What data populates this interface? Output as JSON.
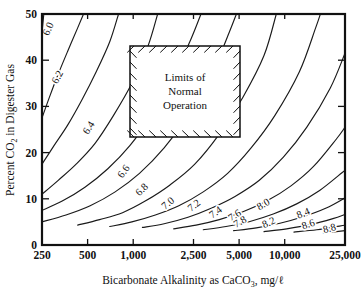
{
  "figure": {
    "title": "",
    "background": "#ffffff",
    "line_color": "#1a1a1a"
  },
  "axes": {
    "x": {
      "label_prefix": "Bicarbonate Alkalinity as CaCO",
      "label_sub": "3",
      "label_suffix": ", mg/ℓ",
      "full_label": "Bicarbonate Alkalinity as CaCO3, mg/ℓ",
      "tick_labels": [
        "250",
        "500",
        "1,000",
        "2,500",
        "5,000",
        "10,000",
        "25,000"
      ],
      "tick_values": [
        250,
        500,
        1000,
        2500,
        5000,
        10000,
        25000
      ],
      "scale": "log",
      "range": [
        250,
        25000
      ]
    },
    "y": {
      "label_prefix": "Percent CO",
      "label_sub": "2",
      "label_suffix": " in Digester Gas",
      "full_label": "Percent CO2 in Digester Gas",
      "tick_labels": [
        "0",
        "10",
        "20",
        "30",
        "40",
        "50"
      ],
      "tick_values": [
        0,
        10,
        20,
        30,
        40,
        50
      ],
      "scale": "linear",
      "range": [
        0,
        50
      ]
    }
  },
  "annotation_box": {
    "lines": [
      "Limits of",
      "Normal",
      "Operation"
    ],
    "x_range": [
      1000,
      5000
    ],
    "y_range": [
      25,
      44
    ],
    "hatched": true
  },
  "chart_data": {
    "type": "line",
    "title": "",
    "subtitle": "",
    "xlabel": "Bicarbonate Alkalinity as CaCO3, mg/ℓ",
    "ylabel": "Percent CO2 in Digester Gas",
    "xlim": [
      250,
      25000
    ],
    "ylim": [
      0,
      50
    ],
    "xscale": "log",
    "yscale": "linear",
    "grid": false,
    "legend": "none",
    "annotations": [
      "Limits of Normal Operation"
    ],
    "contour_variable": "pH",
    "contour_levels": [
      6.0,
      6.2,
      6.4,
      6.6,
      6.8,
      7.0,
      7.2,
      7.4,
      7.6,
      7.8,
      8.0,
      8.2,
      8.4,
      8.6,
      8.8
    ],
    "series": [
      {
        "name": "6.0",
        "label": "6.0",
        "label_pos": [
          288,
          46.5
        ],
        "label_rot": -66,
        "points": [
          [
            250,
            46.0
          ],
          [
            257,
            50.0
          ]
        ]
      },
      {
        "name": "6.2",
        "label": "6.2",
        "label_pos": [
          330,
          36.0
        ],
        "label_rot": -62,
        "points": [
          [
            250,
            27.5
          ],
          [
            280,
            32.0
          ],
          [
            320,
            37.0
          ],
          [
            370,
            42.0
          ],
          [
            430,
            47.0
          ],
          [
            470,
            50.0
          ]
        ]
      },
      {
        "name": "6.4",
        "label": "6.4",
        "label_pos": [
          530,
          25.0
        ],
        "label_rot": -58,
        "points": [
          [
            250,
            17.5
          ],
          [
            300,
            21.5
          ],
          [
            370,
            26.0
          ],
          [
            460,
            31.5
          ],
          [
            570,
            37.5
          ],
          [
            700,
            44.0
          ],
          [
            800,
            50.0
          ]
        ]
      },
      {
        "name": "6.6",
        "label": "6.6",
        "label_pos": [
          900,
          15.5
        ],
        "label_rot": -53,
        "points": [
          [
            250,
            11.0
          ],
          [
            320,
            14.0
          ],
          [
            420,
            17.5
          ],
          [
            560,
            22.0
          ],
          [
            740,
            28.0
          ],
          [
            980,
            35.0
          ],
          [
            1250,
            43.0
          ],
          [
            1450,
            50.0
          ]
        ]
      },
      {
        "name": "6.8",
        "label": "6.8",
        "label_pos": [
          1180,
          11.5
        ],
        "label_rot": -45,
        "points": [
          [
            250,
            7.5
          ],
          [
            340,
            9.5
          ],
          [
            480,
            12.5
          ],
          [
            680,
            16.5
          ],
          [
            950,
            21.5
          ],
          [
            1320,
            28.0
          ],
          [
            1800,
            35.5
          ],
          [
            2400,
            44.5
          ],
          [
            2800,
            50.0
          ]
        ]
      },
      {
        "name": "7.0",
        "label": "7.0",
        "label_pos": [
          1750,
          8.5
        ],
        "label_rot": -40,
        "points": [
          [
            250,
            5.0
          ],
          [
            360,
            6.5
          ],
          [
            520,
            8.5
          ],
          [
            760,
            11.5
          ],
          [
            1100,
            15.5
          ],
          [
            1600,
            21.0
          ],
          [
            2300,
            28.0
          ],
          [
            3300,
            37.0
          ],
          [
            4300,
            46.0
          ],
          [
            4800,
            50.0
          ]
        ]
      },
      {
        "name": "7.2",
        "label": "7.2",
        "label_pos": [
          2600,
          8.0
        ],
        "label_rot": -38,
        "points": [
          [
            430,
            4.3
          ],
          [
            600,
            5.5
          ],
          [
            850,
            7.0
          ],
          [
            1200,
            9.5
          ],
          [
            1750,
            13.0
          ],
          [
            2550,
            17.5
          ],
          [
            3700,
            24.0
          ],
          [
            5300,
            32.0
          ],
          [
            7300,
            41.0
          ],
          [
            8800,
            50.0
          ]
        ]
      },
      {
        "name": "7.4",
        "label": "7.4",
        "label_pos": [
          3600,
          6.5
        ],
        "label_rot": -36,
        "points": [
          [
            700,
            4.0
          ],
          [
            980,
            5.0
          ],
          [
            1400,
            6.5
          ],
          [
            2000,
            8.5
          ],
          [
            2900,
            11.5
          ],
          [
            4200,
            15.5
          ],
          [
            6000,
            21.0
          ],
          [
            8600,
            28.0
          ],
          [
            12500,
            37.5
          ],
          [
            16000,
            47.0
          ],
          [
            17200,
            50.0
          ]
        ]
      },
      {
        "name": "7.6",
        "label": "7.6",
        "label_pos": [
          4800,
          5.8
        ],
        "label_rot": -33,
        "points": [
          [
            1150,
            3.8
          ],
          [
            1600,
            4.6
          ],
          [
            2300,
            6.0
          ],
          [
            3300,
            8.0
          ],
          [
            4700,
            10.5
          ],
          [
            6800,
            14.0
          ],
          [
            9800,
            19.0
          ],
          [
            14000,
            25.5
          ],
          [
            20000,
            34.0
          ],
          [
            25000,
            41.5
          ]
        ]
      },
      {
        "name": "7.8",
        "label": "7.8",
        "label_pos": [
          5200,
          4.4
        ],
        "label_rot": -30,
        "points": [
          [
            1850,
            3.5
          ],
          [
            2600,
            4.3
          ],
          [
            3700,
            5.5
          ],
          [
            5300,
            7.2
          ],
          [
            7600,
            9.5
          ],
          [
            11000,
            12.8
          ],
          [
            15500,
            17.0
          ],
          [
            22000,
            23.0
          ],
          [
            25000,
            25.5
          ]
        ]
      },
      {
        "name": "8.0",
        "label": "8.0",
        "label_pos": [
          7400,
          8.2
        ],
        "label_rot": -30,
        "points": [
          [
            2900,
            3.3
          ],
          [
            4100,
            4.0
          ],
          [
            5900,
            5.1
          ],
          [
            8400,
            6.7
          ],
          [
            12000,
            8.9
          ],
          [
            17000,
            11.8
          ],
          [
            24000,
            15.7
          ],
          [
            25000,
            16.2
          ]
        ]
      },
      {
        "name": "8.2",
        "label": "8.2",
        "label_pos": [
          8000,
          4.2
        ],
        "label_rot": -24,
        "points": [
          [
            4600,
            3.1
          ],
          [
            6500,
            3.7
          ],
          [
            9300,
            4.7
          ],
          [
            13200,
            6.1
          ],
          [
            18800,
            8.0
          ],
          [
            25000,
            10.2
          ]
        ]
      },
      {
        "name": "8.4",
        "label": "8.4",
        "label_pos": [
          13500,
          6.2
        ],
        "label_rot": -22,
        "points": [
          [
            7300,
            2.9
          ],
          [
            10300,
            3.5
          ],
          [
            14700,
            4.4
          ],
          [
            20800,
            5.7
          ],
          [
            25000,
            6.6
          ]
        ]
      },
      {
        "name": "8.6",
        "label": "8.6",
        "label_pos": [
          14500,
          3.8
        ],
        "label_rot": -18,
        "points": [
          [
            11500,
            2.8
          ],
          [
            16300,
            3.3
          ],
          [
            23000,
            4.1
          ],
          [
            25000,
            4.3
          ]
        ]
      },
      {
        "name": "8.8",
        "label": "8.8",
        "label_pos": [
          20000,
          2.9
        ],
        "label_rot": -15,
        "points": [
          [
            18000,
            2.6
          ],
          [
            25000,
            3.1
          ]
        ]
      }
    ]
  }
}
